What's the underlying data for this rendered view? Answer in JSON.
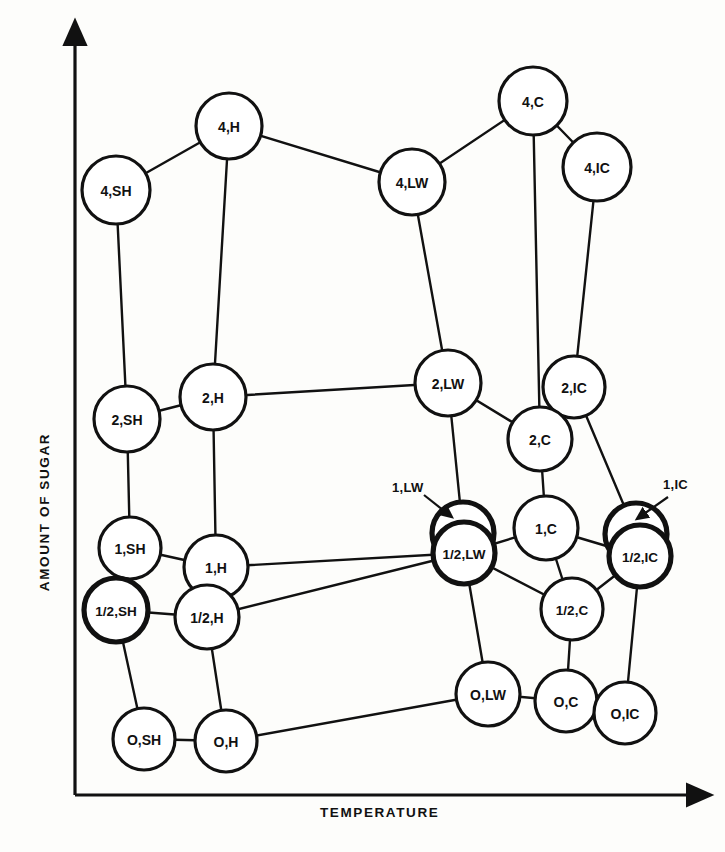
{
  "figure": {
    "type": "network-graph",
    "background_color": "#fdfdfb",
    "ink_color": "#111111"
  },
  "axes": {
    "y_label": "AMOUNT OF SUGAR",
    "x_label": "TEMPERATURE",
    "y_axis": {
      "x": 75,
      "y_top": 40,
      "y_bottom": 795
    },
    "x_axis": {
      "y": 795,
      "x_left": 75,
      "x_right": 692
    }
  },
  "chart_data": {
    "type": "scatter",
    "title": "",
    "xlabel": "TEMPERATURE",
    "ylabel": "AMOUNT OF SUGAR",
    "grid": false,
    "legend": "none",
    "nodes": [
      {
        "id": "4,SH",
        "label": "4,SH",
        "x": 116,
        "y": 190,
        "r": 34,
        "bold": false,
        "font": 14
      },
      {
        "id": "4,H",
        "label": "4,H",
        "x": 229,
        "y": 126,
        "r": 33,
        "bold": false,
        "font": 14
      },
      {
        "id": "4,LW",
        "label": "4,LW",
        "x": 412,
        "y": 182,
        "r": 33,
        "bold": false,
        "font": 14
      },
      {
        "id": "4,C",
        "label": "4,C",
        "x": 533,
        "y": 101,
        "r": 34,
        "bold": false,
        "font": 14
      },
      {
        "id": "4,IC",
        "label": "4,IC",
        "x": 597,
        "y": 167,
        "r": 34,
        "bold": false,
        "font": 14
      },
      {
        "id": "2,SH",
        "label": "2,SH",
        "x": 127,
        "y": 419,
        "r": 33,
        "bold": false,
        "font": 14
      },
      {
        "id": "2,H",
        "label": "2,H",
        "x": 213,
        "y": 397,
        "r": 33,
        "bold": false,
        "font": 14
      },
      {
        "id": "2,LW",
        "label": "2,LW",
        "x": 448,
        "y": 383,
        "r": 33,
        "bold": false,
        "font": 14
      },
      {
        "id": "2,IC",
        "label": "2,IC",
        "x": 574,
        "y": 387,
        "r": 31,
        "bold": false,
        "font": 14
      },
      {
        "id": "2,C",
        "label": "2,C",
        "x": 540,
        "y": 439,
        "r": 32,
        "bold": false,
        "font": 14
      },
      {
        "id": "1,SH",
        "label": "1,SH",
        "x": 130,
        "y": 548,
        "r": 31,
        "bold": false,
        "font": 14
      },
      {
        "id": "1,H",
        "label": "1,H",
        "x": 216,
        "y": 567,
        "r": 32,
        "bold": false,
        "font": 14
      },
      {
        "id": "1,LW",
        "label": "",
        "x": 463,
        "y": 533,
        "r": 31,
        "bold": true,
        "font": 14
      },
      {
        "id": "1,C",
        "label": "1,C",
        "x": 546,
        "y": 528,
        "r": 32,
        "bold": false,
        "font": 14
      },
      {
        "id": "1,IC",
        "label": "",
        "x": 636,
        "y": 534,
        "r": 31,
        "bold": true,
        "font": 14
      },
      {
        "id": "1/2,SH",
        "label": "1/2,SH",
        "x": 116,
        "y": 610,
        "r": 32,
        "bold": true,
        "font": 13.5
      },
      {
        "id": "1/2,H",
        "label": "1/2,H",
        "x": 207,
        "y": 617,
        "r": 32,
        "bold": false,
        "font": 14
      },
      {
        "id": "1/2,LW",
        "label": "1/2,LW",
        "x": 464,
        "y": 553,
        "r": 31,
        "bold": true,
        "font": 13.5
      },
      {
        "id": "1/2,C",
        "label": "1/2,C",
        "x": 572,
        "y": 609,
        "r": 31,
        "bold": false,
        "font": 13.5
      },
      {
        "id": "1/2,IC",
        "label": "1/2,IC",
        "x": 640,
        "y": 556,
        "r": 31,
        "bold": true,
        "font": 13.5
      },
      {
        "id": "O,SH",
        "label": "O,SH",
        "x": 144,
        "y": 739,
        "r": 31,
        "bold": false,
        "font": 14
      },
      {
        "id": "O,H",
        "label": "O,H",
        "x": 226,
        "y": 741,
        "r": 31,
        "bold": false,
        "font": 14
      },
      {
        "id": "O,LW",
        "label": "O,LW",
        "x": 488,
        "y": 694,
        "r": 32,
        "bold": false,
        "font": 14
      },
      {
        "id": "O,C",
        "label": "O,C",
        "x": 566,
        "y": 701,
        "r": 31,
        "bold": false,
        "font": 14
      },
      {
        "id": "O,IC",
        "label": "O,IC",
        "x": 625,
        "y": 713,
        "r": 31,
        "bold": false,
        "font": 14
      }
    ],
    "edges": [
      [
        "4,SH",
        "4,H"
      ],
      [
        "4,H",
        "4,LW"
      ],
      [
        "4,LW",
        "4,C"
      ],
      [
        "4,C",
        "4,IC"
      ],
      [
        "4,SH",
        "2,SH"
      ],
      [
        "4,H",
        "2,H"
      ],
      [
        "4,LW",
        "2,LW"
      ],
      [
        "4,C",
        "2,C"
      ],
      [
        "4,IC",
        "2,IC"
      ],
      [
        "2,SH",
        "2,H"
      ],
      [
        "2,H",
        "2,LW"
      ],
      [
        "2,LW",
        "2,C"
      ],
      [
        "2,IC",
        "1,IC"
      ],
      [
        "2,SH",
        "1,SH"
      ],
      [
        "2,H",
        "1,H"
      ],
      [
        "2,LW",
        "1,LW"
      ],
      [
        "2,C",
        "1,C"
      ],
      [
        "1,SH",
        "1,H"
      ],
      [
        "1,H",
        "1/2,LW"
      ],
      [
        "1,C",
        "1/2,LW"
      ],
      [
        "1,C",
        "1/2,IC"
      ],
      [
        "1,C",
        "1/2,C"
      ],
      [
        "1,SH",
        "1/2,SH"
      ],
      [
        "1,H",
        "1/2,H"
      ],
      [
        "1/2,SH",
        "1/2,H"
      ],
      [
        "1/2,H",
        "1/2,LW"
      ],
      [
        "1/2,LW",
        "1/2,C"
      ],
      [
        "1/2,C",
        "1/2,IC"
      ],
      [
        "1/2,SH",
        "O,SH"
      ],
      [
        "1/2,H",
        "O,H"
      ],
      [
        "1/2,LW",
        "O,LW"
      ],
      [
        "1/2,C",
        "O,C"
      ],
      [
        "1/2,IC",
        "O,IC"
      ],
      [
        "O,SH",
        "O,H"
      ],
      [
        "O,H",
        "O,LW"
      ],
      [
        "O,LW",
        "O,C"
      ]
    ]
  },
  "callouts": [
    {
      "name": "callout-1-lw",
      "label": "1,LW",
      "label_x": 392,
      "label_y": 492,
      "arrow_from_x": 424,
      "arrow_from_y": 495,
      "arrow_to_x": 448,
      "arrow_to_y": 514
    },
    {
      "name": "callout-1-ic",
      "label": "1,IC",
      "label_x": 663,
      "label_y": 489,
      "arrow_from_x": 668,
      "arrow_from_y": 497,
      "arrow_to_x": 641,
      "arrow_to_y": 516
    }
  ]
}
